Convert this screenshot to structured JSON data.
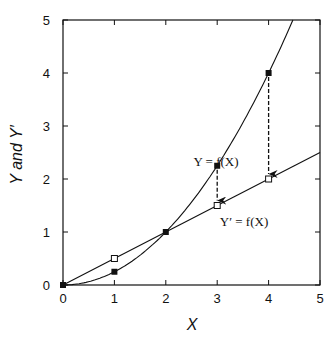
{
  "chart_data": {
    "type": "line",
    "title": "",
    "xlabel": "X",
    "ylabel": "Y and Y′",
    "xlim": [
      0,
      5
    ],
    "ylim": [
      0,
      5
    ],
    "x_ticks": [
      "0",
      "1",
      "2",
      "3",
      "4",
      "5"
    ],
    "y_ticks": [
      "0",
      "1",
      "2",
      "3",
      "4",
      "5"
    ],
    "grid": false,
    "series": [
      {
        "name": "Y = f(X)",
        "curve": "Y = X^2/4",
        "marker": "filled-square",
        "x": [
          0,
          1,
          2,
          3,
          4
        ],
        "values": [
          0,
          0.25,
          1,
          2.25,
          4
        ]
      },
      {
        "name": "Y′ = f(X)",
        "curve": "Y' = X/2",
        "marker": "open-square",
        "x": [
          0,
          1,
          2,
          3,
          4
        ],
        "values": [
          0,
          0.5,
          1,
          1.5,
          2
        ]
      }
    ],
    "annotations": [
      {
        "text": "Y = f(X)",
        "x": 3,
        "y": 2.25
      },
      {
        "text": "Y′ = f(X)",
        "x": 3,
        "y": 1.5
      },
      {
        "type": "dashed-arrow",
        "from": [
          3,
          2.25
        ],
        "to": [
          3,
          1.5
        ]
      },
      {
        "type": "dashed-arrow",
        "from": [
          4,
          4
        ],
        "to": [
          4,
          2
        ]
      }
    ]
  },
  "labels": {
    "x_axis": "X",
    "y_axis": "Y and Y′",
    "curve_label": "Y = f(X)",
    "line_label": "Y′ = f(X)",
    "ticks": [
      "0",
      "1",
      "2",
      "3",
      "4",
      "5"
    ]
  }
}
